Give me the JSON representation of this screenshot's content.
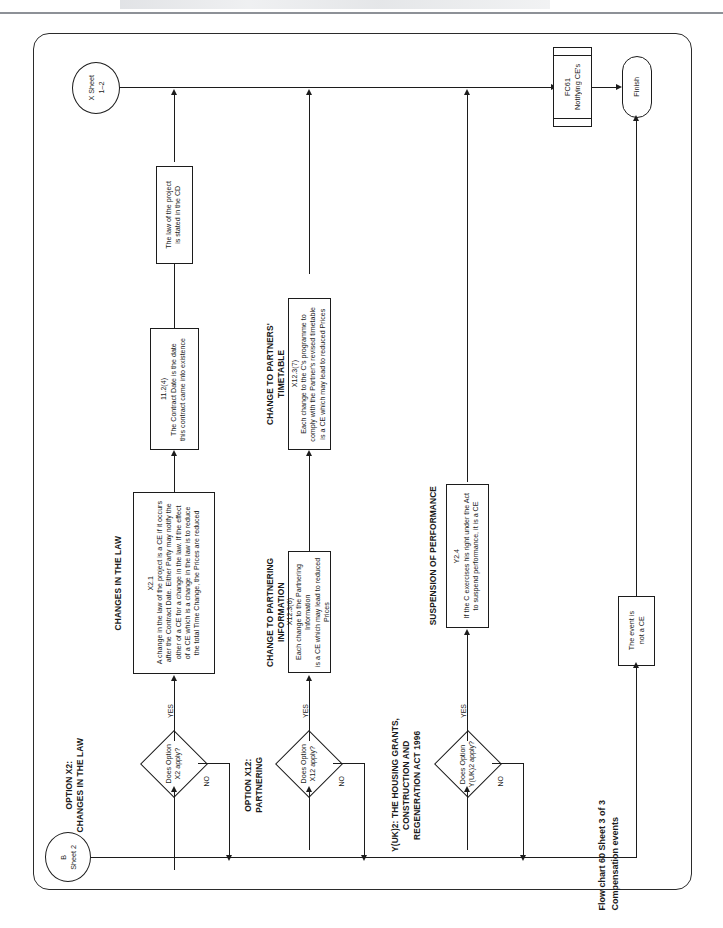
{
  "document": {
    "caption_line1": "Flow chart 60 Sheet 3 of 3",
    "caption_line2": "Compensation events"
  },
  "connectors": {
    "entry_b": "B\nSheet 2",
    "spine_x": "X Sheet\n1–2"
  },
  "terminators": {
    "finish": "Finish"
  },
  "predefined": {
    "fc61": "FC61\nNotifying CE's"
  },
  "sections": [
    {
      "id": "x2",
      "heading": "OPTION X2:\nCHANGES IN THE LAW",
      "decision": "Does Option\nX2 apply?",
      "yes_label": "YES",
      "no_label": "NO",
      "group_heading": "CHANGES IN THE LAW",
      "clause_ref": "X2.1",
      "clause_text": "A change in the law of the project is a CE if it occurs\nafter the Contract Date. Either Party may notify the\nother of a CE for a change in the law. If the effect\nof a CE which is a change in the law is to reduce\nthe total Time Change, the Prices are reduced"
    },
    {
      "id": "x12",
      "heading": "OPTION X12:\nPARTNERING",
      "decision": "Does Option\nX12 apply?",
      "yes_label": "YES",
      "no_label": "NO",
      "group_heading": "CHANGE TO PARTNERING INFORMATION",
      "clause_ref": "X12.3(6)",
      "clause_text": "Each change to the Partnering Information\nis a CE which may lead to reduced Prices"
    },
    {
      "id": "yuk2",
      "heading": "Y(UK)2: THE HOUSING GRANTS,\nCONSTRUCTION AND\nREGENERATION ACT 1996",
      "decision": "Does Option\nY(UK)2 apply?",
      "yes_label": "YES",
      "no_label": "NO",
      "group_heading": "SUSPENSION OF PERFORMANCE",
      "clause_ref": "Y2.4",
      "clause_text": "If the C exercises his right under the Act\nto suspend performance, it is a CE"
    }
  ],
  "secondary": {
    "timetable_heading": "CHANGE TO PARTNERS' TIMETABLE",
    "timetable_ref": "X12.3(7)",
    "timetable_text": "Each change to the C's programme to\ncomply with the Partner's revised timetable\nis a CE which may lead to reduced Prices",
    "contract_date_ref": "11.2(4)",
    "contract_date_text": "The Contract Date is the date\nthis contract came into existence",
    "law_cd_text": "The law of the project\nis stated in the CD",
    "not_a_ce": "The event is\nnot a CE"
  },
  "colors": {
    "ink": "#1c1c1c",
    "paper": "#ffffff",
    "rule": "#8d9197"
  }
}
